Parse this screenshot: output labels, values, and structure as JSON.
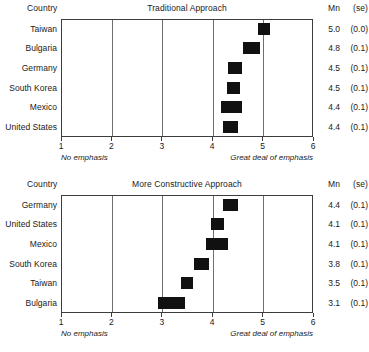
{
  "chart_data": [
    {
      "type": "bar",
      "title": "Traditional Approach",
      "xlabel": "",
      "ylabel": "Country",
      "xlim": [
        1,
        6
      ],
      "xticks": [
        "1",
        "2",
        "3",
        "4",
        "5",
        "6"
      ],
      "grid": true,
      "legend": "none",
      "orientation": "horizontal",
      "column_headers": {
        "country": "Country",
        "mean": "Mn",
        "se": "(se)"
      },
      "axis_notes": {
        "left": "No emphasis",
        "right": "Great deal of emphasis"
      },
      "categories": [
        "Taiwan",
        "Bulgaria",
        "Germany",
        "South Korea",
        "Mexico",
        "United States"
      ],
      "values": [
        5.0,
        4.8,
        4.5,
        4.5,
        4.4,
        4.4
      ],
      "rows": [
        {
          "country": "Taiwan",
          "mean": 5.0,
          "mean_label": "5.0",
          "se": 0.0,
          "se_label": "(0.0)",
          "bar_start": 4.9,
          "bar_end": 5.15
        },
        {
          "country": "Bulgaria",
          "mean": 4.8,
          "mean_label": "4.8",
          "se": 0.1,
          "se_label": "(0.1)",
          "bar_start": 4.62,
          "bar_end": 4.95
        },
        {
          "country": "Germany",
          "mean": 4.5,
          "mean_label": "4.5",
          "se": 0.1,
          "se_label": "(0.1)",
          "bar_start": 4.32,
          "bar_end": 4.6
        },
        {
          "country": "South Korea",
          "mean": 4.5,
          "mean_label": "4.5",
          "se": 0.1,
          "se_label": "(0.1)",
          "bar_start": 4.3,
          "bar_end": 4.56
        },
        {
          "country": "Mexico",
          "mean": 4.4,
          "mean_label": "4.4",
          "se": 0.1,
          "se_label": "(0.1)",
          "bar_start": 4.18,
          "bar_end": 4.6
        },
        {
          "country": "United States",
          "mean": 4.4,
          "mean_label": "4.4",
          "se": 0.1,
          "se_label": "(0.1)",
          "bar_start": 4.22,
          "bar_end": 4.52
        }
      ]
    },
    {
      "type": "bar",
      "title": "More Constructive Approach",
      "xlabel": "",
      "ylabel": "Country",
      "xlim": [
        1,
        6
      ],
      "xticks": [
        "1",
        "2",
        "3",
        "4",
        "5",
        "6"
      ],
      "grid": true,
      "legend": "none",
      "orientation": "horizontal",
      "column_headers": {
        "country": "Country",
        "mean": "Mn",
        "se": "(se)"
      },
      "axis_notes": {
        "left": "No emphasis",
        "right": "Great deal of emphasis"
      },
      "categories": [
        "Germany",
        "United States",
        "Mexico",
        "South Korea",
        "Taiwan",
        "Bulgaria"
      ],
      "values": [
        4.4,
        4.1,
        4.1,
        3.8,
        3.5,
        3.1
      ],
      "rows": [
        {
          "country": "Germany",
          "mean": 4.4,
          "mean_label": "4.4",
          "se": 0.1,
          "se_label": "(0.1)",
          "bar_start": 4.22,
          "bar_end": 4.52
        },
        {
          "country": "United States",
          "mean": 4.1,
          "mean_label": "4.1",
          "se": 0.1,
          "se_label": "(0.1)",
          "bar_start": 3.98,
          "bar_end": 4.24
        },
        {
          "country": "Mexico",
          "mean": 4.1,
          "mean_label": "4.1",
          "se": 0.1,
          "se_label": "(0.1)",
          "bar_start": 3.88,
          "bar_end": 4.32
        },
        {
          "country": "South Korea",
          "mean": 3.8,
          "mean_label": "3.8",
          "se": 0.1,
          "se_label": "(0.1)",
          "bar_start": 3.64,
          "bar_end": 3.94
        },
        {
          "country": "Taiwan",
          "mean": 3.5,
          "mean_label": "3.5",
          "se": 0.1,
          "se_label": "(0.1)",
          "bar_start": 3.38,
          "bar_end": 3.62
        },
        {
          "country": "Bulgaria",
          "mean": 3.1,
          "mean_label": "3.1",
          "se": 0.1,
          "se_label": "(0.1)",
          "bar_start": 2.92,
          "bar_end": 3.46
        }
      ]
    }
  ],
  "style": {
    "bar_color": "#111111",
    "box_color": "#3d3d3d",
    "grid_color": "#6e6e6e",
    "text_color": "#1a1a1a",
    "background": "#ffffff"
  }
}
